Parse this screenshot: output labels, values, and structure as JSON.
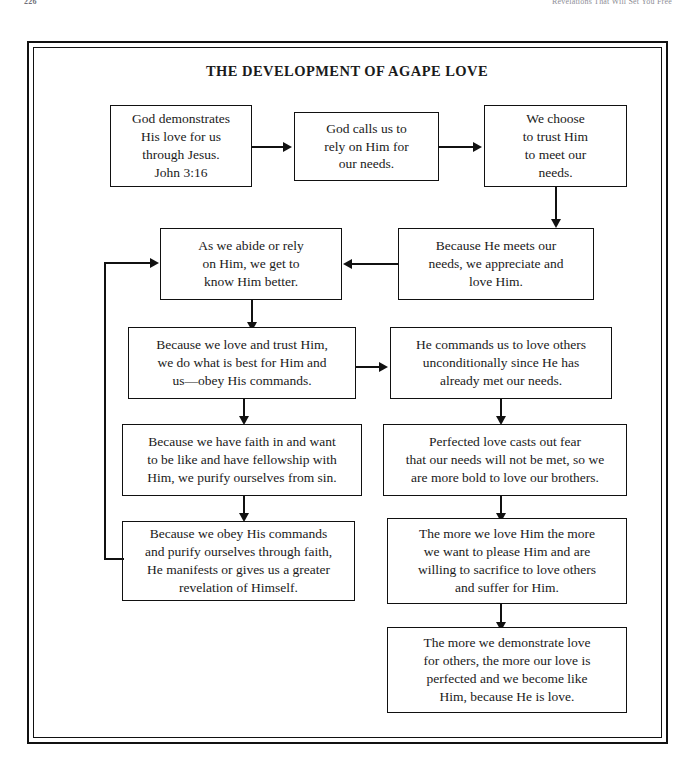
{
  "page": {
    "folio": "226",
    "running_head": "Revelations That Will Set You Free"
  },
  "figure": {
    "title": "THE DEVELOPMENT OF AGAPE LOVE"
  },
  "nodes": {
    "n1": {
      "text": "God demonstrates\nHis love for us\nthrough Jesus.\nJohn 3:16"
    },
    "n2": {
      "text": "God calls us to\nrely on Him for\nour needs."
    },
    "n3": {
      "text": "We choose\nto trust Him\nto meet our\nneeds."
    },
    "n4": {
      "text": "Because He meets our\nneeds, we appreciate and\nlove Him."
    },
    "n5": {
      "text": "As we abide or rely\non Him, we get to\nknow Him better."
    },
    "n6": {
      "text": "Because we love and trust Him,\nwe do what is best for Him and\nus—obey His commands."
    },
    "n7": {
      "text": "He commands us to love others\nunconditionally since He has\nalready met our needs."
    },
    "n8": {
      "text": "Because we have faith in and want\nto be like and have fellowship with\nHim, we purify ourselves from sin."
    },
    "n9": {
      "text": "Perfected love casts out fear\nthat our needs will not be met, so we\nare more bold to love our brothers."
    },
    "n10": {
      "text": "Because we obey His commands\nand purify ourselves through faith,\nHe manifests or gives us a greater\nrevelation of Himself."
    },
    "n11": {
      "text": "The more we love Him the more\nwe want to please Him and are\nwilling to sacrifice to love others\nand suffer for Him."
    },
    "n12": {
      "text": "The more we demonstrate love\nfor others, the more our love is\nperfected and we become like\nHim, because He is love."
    }
  },
  "colors": {
    "ink": "#111111",
    "paper": "#ffffff",
    "runhead": "#8e8e96"
  }
}
